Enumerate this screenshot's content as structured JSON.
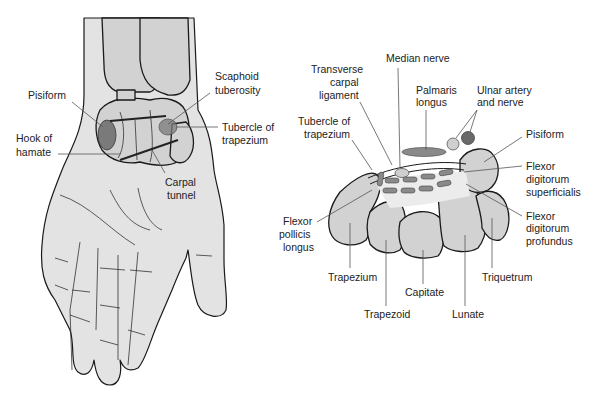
{
  "figure": {
    "left_panel": {
      "title": "Palmar view of wrist and hand",
      "labels": {
        "pisiform": "Pisiform",
        "hook_of_hamate_1": "Hook of",
        "hook_of_hamate_2": "hamate",
        "scaphoid_tuberosity_1": "Scaphoid",
        "scaphoid_tuberosity_2": "tuberosity",
        "tubercle_trapezium_1": "Tubercle of",
        "tubercle_trapezium_2": "trapezium",
        "carpal_tunnel_1": "Carpal",
        "carpal_tunnel_2": "tunnel"
      }
    },
    "right_panel": {
      "title": "Cross-section of carpal tunnel",
      "labels": {
        "median_nerve": "Median nerve",
        "transverse_1": "Transverse",
        "transverse_2": "carpal",
        "transverse_3": "ligament",
        "palmaris_1": "Palmaris",
        "palmaris_2": "longus",
        "ulnar_1": "Ulnar artery",
        "ulnar_2": "and nerve",
        "tubercle_1": "Tubercle of",
        "tubercle_2": "trapezium",
        "pisiform": "Pisiform",
        "fds_1": "Flexor",
        "fds_2": "digitorum",
        "fds_3": "superficialis",
        "fpl_1": "Flexor",
        "fpl_2": "pollicis",
        "fpl_3": "longus",
        "fdp_1": "Flexor",
        "fdp_2": "digitorum",
        "fdp_3": "profundus",
        "trapezium": "Trapezium",
        "triquetrum": "Triquetrum",
        "capitate": "Capitate",
        "trapezoid": "Trapezoid",
        "lunate": "Lunate"
      }
    },
    "colors": {
      "skin": "#e3e3e3",
      "bone": "#d2d2d2",
      "highlight": "#7a7a7a",
      "outline": "#1a1a1a"
    }
  }
}
